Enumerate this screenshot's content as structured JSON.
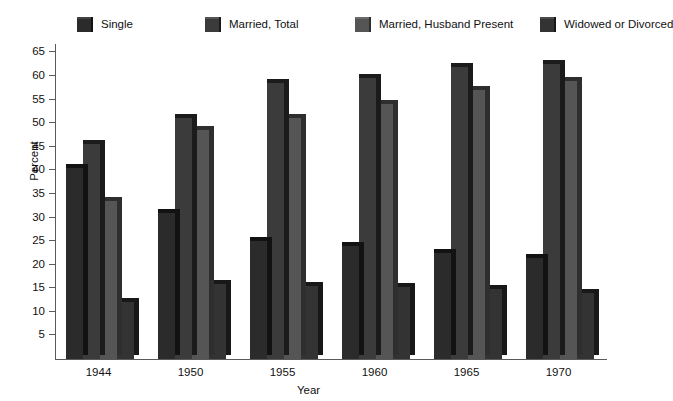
{
  "chart_data": {
    "type": "bar",
    "title": "",
    "xlabel": "Year",
    "ylabel": "Percent",
    "categories": [
      "1944",
      "1950",
      "1955",
      "1960",
      "1965",
      "1970"
    ],
    "ylim": [
      0,
      67
    ],
    "yticks": [
      5,
      10,
      15,
      20,
      25,
      30,
      35,
      40,
      45,
      50,
      55,
      60,
      65
    ],
    "grid": false,
    "legend_position": "top",
    "series": [
      {
        "name": "Single",
        "color": "#2b2b2b",
        "side_color": "#121212",
        "top_color": "#434343",
        "values": [
          40.5,
          31.0,
          25.0,
          24.0,
          22.5,
          21.5
        ]
      },
      {
        "name": "Married, Total",
        "color": "#3b3b3b",
        "side_color": "#1b1b1b",
        "top_color": "#545454",
        "values": [
          45.5,
          51.0,
          58.5,
          59.5,
          62.0,
          62.5
        ]
      },
      {
        "name": "Married, Husband Present",
        "color": "#555555",
        "side_color": "#2e2e2e",
        "top_color": "#6b6b6b",
        "values": [
          33.5,
          48.5,
          51.0,
          54.0,
          57.0,
          59.0
        ]
      },
      {
        "name": "Widowed or Divorced",
        "color": "#333333",
        "side_color": "#181818",
        "top_color": "#4a4a4a",
        "values": [
          12.0,
          15.8,
          15.5,
          15.2,
          14.8,
          14.0
        ]
      }
    ]
  },
  "legend": {
    "items": [
      {
        "label": "Single",
        "x": 22
      },
      {
        "label": "Married, Total",
        "x": 150
      },
      {
        "label": "Married, Husband Present",
        "x": 300
      },
      {
        "label": "Widowed or Divorced",
        "x": 485
      }
    ]
  }
}
